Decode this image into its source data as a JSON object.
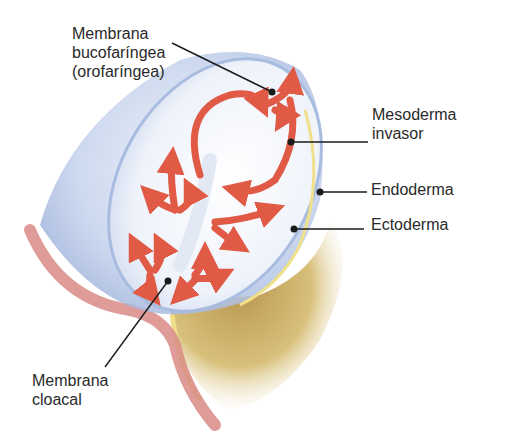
{
  "diagram": {
    "type": "anatomical-illustration",
    "colors": {
      "ectoderm_blue": "#b9c9e8",
      "disc_white": "#eef2fa",
      "mesoderm_arrows": "#e05a45",
      "endoderm_yellow": "#f0e08a",
      "yolk_sac_tan": "#c8a860",
      "amnion_pink": "#d88a86",
      "leader_line": "#1a1a1a"
    },
    "labels": [
      {
        "id": "oropharyngeal",
        "lines": [
          "Membrana",
          "bucofaríngea",
          "(orofaríngea)"
        ]
      },
      {
        "id": "invading-mesoderm",
        "lines": [
          "Mesoderma",
          "invasor"
        ]
      },
      {
        "id": "endoderm",
        "lines": [
          "Endoderma"
        ]
      },
      {
        "id": "ectoderm",
        "lines": [
          "Ectoderma"
        ]
      },
      {
        "id": "cloacal",
        "lines": [
          "Membrana",
          "cloacal"
        ]
      }
    ]
  }
}
